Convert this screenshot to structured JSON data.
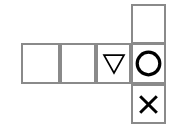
{
  "figure": {
    "title": "Shape Grid Puzzle",
    "type": "shape-grid",
    "background_color": "#ffffff",
    "grid_line_color": "#8a8a8a",
    "glyph_color": "#000000",
    "cell_size_px": 35,
    "rows": 3,
    "columns": 4,
    "layout_description": "T-shaped / cross-shaped polyomino grid: a horizontal strip of four cells in the middle row, with one extra cell above the rightmost column cell and one extra cell below it."
  },
  "cells": [
    {
      "id": "cell-top-right",
      "row": 1,
      "column": 4,
      "x": 131,
      "y": 4,
      "width": 35,
      "height": 40,
      "shape": "none",
      "shape_label": "empty",
      "is_empty": true
    },
    {
      "id": "cell-mid-1",
      "row": 2,
      "column": 1,
      "x": 21,
      "y": 43,
      "width": 39,
      "height": 41,
      "shape": "none",
      "shape_label": "empty",
      "is_empty": true
    },
    {
      "id": "cell-mid-2",
      "row": 2,
      "column": 2,
      "x": 60,
      "y": 43,
      "width": 36,
      "height": 41,
      "shape": "none",
      "shape_label": "empty",
      "is_empty": true
    },
    {
      "id": "cell-mid-3",
      "row": 2,
      "column": 3,
      "x": 96,
      "y": 43,
      "width": 35,
      "height": 41,
      "shape": "triangle-down",
      "shape_label": "downward pointing triangle outline",
      "is_empty": false
    },
    {
      "id": "cell-mid-4",
      "row": 2,
      "column": 4,
      "x": 131,
      "y": 43,
      "width": 35,
      "height": 41,
      "shape": "circle",
      "shape_label": "circle outline",
      "is_empty": false
    },
    {
      "id": "cell-bottom-right",
      "row": 3,
      "column": 4,
      "x": 131,
      "y": 84,
      "width": 35,
      "height": 40,
      "shape": "cross",
      "shape_label": "X cross mark",
      "is_empty": false
    }
  ],
  "glyphs": {
    "triangle_down": {
      "name": "triangle-down-icon",
      "stroke_width": 1.6,
      "size": 22
    },
    "circle": {
      "name": "circle-icon",
      "stroke_width": 3.2,
      "diameter": 25
    },
    "cross": {
      "name": "x-cross-icon",
      "stroke_width": 3.0,
      "size": 19
    }
  }
}
